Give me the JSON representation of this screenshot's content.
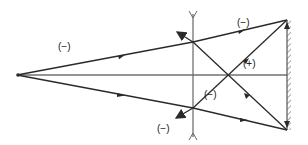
{
  "diagram": {
    "type": "ray-optics",
    "colors": {
      "line": "#2a2a2a",
      "lens": "#666666",
      "mirror": "#555555",
      "background": "#ffffff"
    },
    "labels": {
      "upper_incident": "(−)",
      "upper_right": "(−)",
      "reflected_plus": "(+)",
      "center_minus": "(−)",
      "lower_left": "(−)"
    },
    "components": {
      "source": "point-source",
      "lens": "diverging-lens",
      "mirror": "plane-mirror"
    }
  }
}
